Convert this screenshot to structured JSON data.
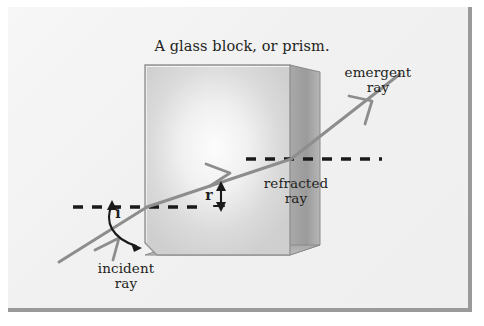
{
  "figure": {
    "title": "A glass block, or prism.",
    "background_color": "#f2f2f2",
    "plate_border_color": "#9a9a9a"
  },
  "labels": {
    "title": "A glass block, or prism.",
    "emergent_ray": "emergent\nray",
    "refracted_ray": "refracted\nray",
    "incident_ray": "incident\nray",
    "angle_of_incidence": "i",
    "angle_of_refraction": "r"
  },
  "colors": {
    "ray": "#8d8d8d",
    "dashed_normal": "#1a1a1a",
    "block_front_face": "#d8d8d8",
    "block_front_highlight": "#fbfbfb",
    "block_right_face": "#9d9d9d",
    "block_bottom_face": "#b4b4b4",
    "block_outline": "#8f8f8f",
    "text": "#231f20"
  },
  "elements": {
    "glass_block": "glass-block",
    "incident_ray": "incident-ray",
    "refracted_ray": "refracted-ray",
    "emergent_ray": "emergent-ray",
    "left_normal": "left-dashed-normal-line",
    "right_normal": "right-dashed-normal-line",
    "angle_i_arc": "angle-i-curved-arrow",
    "angle_r_arc": "angle-r-vertical-arrow"
  }
}
